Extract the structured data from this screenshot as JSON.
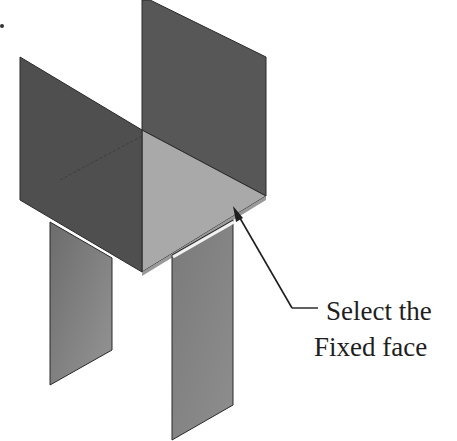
{
  "figure": {
    "callout": {
      "line1": "Select the",
      "line2": "Fixed face"
    },
    "colors": {
      "dark_wall": "#555555",
      "floor": "#aaaaaa",
      "legs": "#8a8a8a",
      "edge": "#2a2a2a",
      "text": "#1e1e1e"
    }
  }
}
